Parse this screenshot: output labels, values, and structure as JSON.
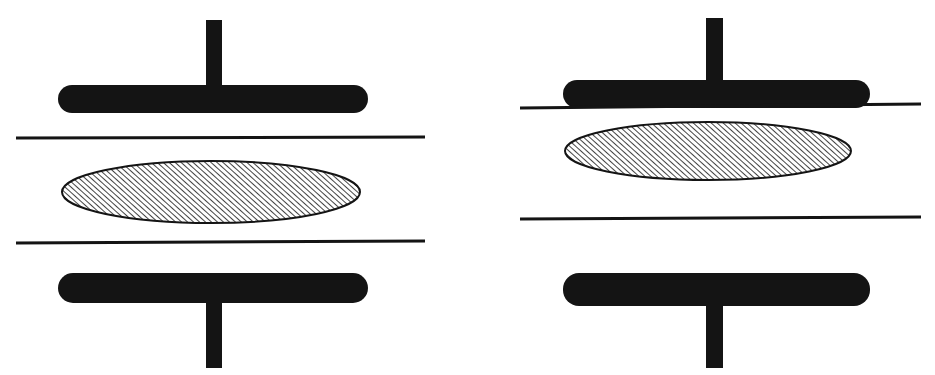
{
  "figure": {
    "title": "",
    "caption": "",
    "background_color": "#ffffff",
    "ink_color": "#141414",
    "width": 935,
    "height": 375
  },
  "chart_data": {
    "type": "diagram",
    "title": "",
    "xlabel": "",
    "ylabel": "",
    "panels": [
      {
        "name": "left-panel",
        "label": "",
        "elements": [
          {
            "role": "upper-stem",
            "shape": "rect",
            "x": 206,
            "y": 20,
            "width": 16,
            "height": 70,
            "fill": "#141414"
          },
          {
            "role": "upper-bar",
            "shape": "rounded-bar",
            "x": 58,
            "y": 85,
            "width": 310,
            "height": 28,
            "radius": 14,
            "fill": "#141414"
          },
          {
            "role": "upper-reference-line",
            "shape": "line",
            "x1": 16,
            "y1": 138,
            "x2": 425,
            "y2": 137,
            "stroke": "#141414",
            "stroke_width": 3
          },
          {
            "role": "hatched-ellipse",
            "shape": "ellipse",
            "cx": 211,
            "cy": 192,
            "rx": 149,
            "ry": 31,
            "fill": "hatch-45",
            "stroke": "#141414",
            "stroke_width": 2
          },
          {
            "role": "lower-reference-line",
            "shape": "line",
            "x1": 16,
            "y1": 243,
            "x2": 425,
            "y2": 241,
            "stroke": "#141414",
            "stroke_width": 3
          },
          {
            "role": "lower-bar",
            "shape": "rounded-bar",
            "x": 58,
            "y": 273,
            "width": 310,
            "height": 30,
            "radius": 15,
            "fill": "#141414"
          },
          {
            "role": "lower-stem",
            "shape": "rect",
            "x": 206,
            "y": 300,
            "width": 16,
            "height": 68,
            "fill": "#141414"
          }
        ]
      },
      {
        "name": "right-panel",
        "label": "",
        "elements": [
          {
            "role": "upper-stem",
            "shape": "rect",
            "x": 706,
            "y": 18,
            "width": 17,
            "height": 68,
            "fill": "#141414"
          },
          {
            "role": "upper-bar",
            "shape": "rounded-bar",
            "x": 563,
            "y": 80,
            "width": 307,
            "height": 28,
            "radius": 14,
            "fill": "#141414"
          },
          {
            "role": "upper-reference-line",
            "shape": "line",
            "x1": 520,
            "y1": 108,
            "x2": 921,
            "y2": 104,
            "stroke": "#141414",
            "stroke_width": 3
          },
          {
            "role": "hatched-ellipse",
            "shape": "ellipse",
            "cx": 708,
            "cy": 151,
            "rx": 143,
            "ry": 29,
            "fill": "hatch-45",
            "stroke": "#141414",
            "stroke_width": 2
          },
          {
            "role": "lower-reference-line",
            "shape": "line",
            "x1": 520,
            "y1": 219,
            "x2": 921,
            "y2": 217,
            "stroke": "#141414",
            "stroke_width": 3
          },
          {
            "role": "lower-bar",
            "shape": "rounded-bar",
            "x": 563,
            "y": 273,
            "width": 307,
            "height": 33,
            "radius": 16,
            "fill": "#141414"
          },
          {
            "role": "lower-stem",
            "shape": "rect",
            "x": 706,
            "y": 303,
            "width": 17,
            "height": 65,
            "fill": "#141414"
          }
        ]
      }
    ],
    "hatch": {
      "direction": "forward-slash",
      "angle_deg": 45,
      "spacing_px": 4,
      "line_width_px": 1.6,
      "color": "#141414",
      "background": "#ffffff"
    }
  }
}
